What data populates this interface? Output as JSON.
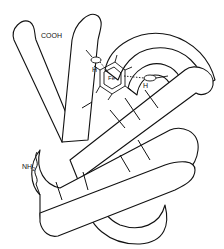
{
  "diagram": {
    "type": "protein ribbon structure (myoglobin-like fold with heme)",
    "labels": {
      "c_terminus": "COOH",
      "n_terminus": "NH",
      "n_terminus_sub": "2",
      "histidine_proximal": "H",
      "histidine_distal": "H",
      "iron": "Fe"
    },
    "colors": {
      "stroke": "#111111",
      "background": "#ffffff"
    }
  }
}
